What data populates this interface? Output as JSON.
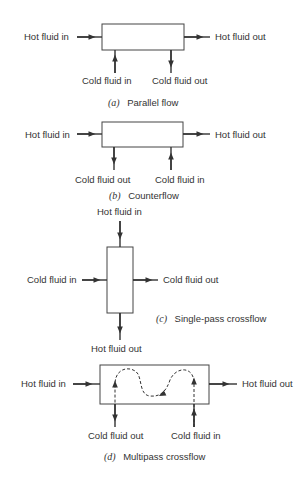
{
  "figure": {
    "panels": [
      {
        "id": "a",
        "caption_letter": "(a)",
        "caption_text": "Parallel flow",
        "labels": {
          "hot_in": "Hot fluid in",
          "hot_out": "Hot fluid out",
          "cold_left": "Cold fluid in",
          "cold_right": "Cold fluid out"
        }
      },
      {
        "id": "b",
        "caption_letter": "(b)",
        "caption_text": "Counterflow",
        "labels": {
          "hot_in": "Hot fluid in",
          "hot_out": "Hot fluid out",
          "cold_left": "Cold fluid out",
          "cold_right": "Cold fluid in"
        }
      },
      {
        "id": "c",
        "caption_letter": "(c)",
        "caption_text": "Single-pass crossflow",
        "labels": {
          "hot_in": "Hot fluid in",
          "hot_out": "Hot fluid out",
          "cold_in": "Cold fluid in",
          "cold_out": "Cold fluid out"
        }
      },
      {
        "id": "d",
        "caption_letter": "(d)",
        "caption_text": "Multipass crossflow",
        "labels": {
          "hot_in": "Hot fluid in",
          "hot_out": "Hot fluid out",
          "cold_left": "Cold fluid out",
          "cold_right": "Cold fluid in"
        }
      }
    ]
  }
}
